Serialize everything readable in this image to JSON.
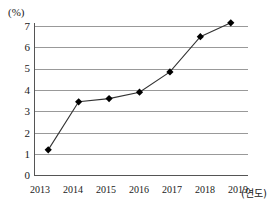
{
  "chart_data": {
    "type": "line",
    "title": "",
    "subtitle": "",
    "xlabel": "(연도)",
    "ylabel": "(%)",
    "categories": [
      "2013",
      "2014",
      "2015",
      "2016",
      "2017",
      "2018",
      "2019"
    ],
    "x": [
      2013,
      2014,
      2015,
      2016,
      2017,
      2018,
      2019
    ],
    "values": [
      1.2,
      3.45,
      3.6,
      3.9,
      4.85,
      6.5,
      7.15
    ],
    "series": [
      {
        "name": "",
        "values": [
          1.2,
          3.45,
          3.6,
          3.9,
          4.85,
          6.5,
          7.15
        ]
      }
    ],
    "ylim": [
      0,
      7
    ],
    "xlim": [
      2013,
      2019
    ],
    "ytick_labels": [
      "0",
      "1",
      "2",
      "3",
      "4",
      "5",
      "6",
      "7"
    ],
    "yticks": [
      0,
      1,
      2,
      3,
      4,
      5,
      6,
      7
    ],
    "grid": true,
    "grid_axis": "y",
    "legend": false,
    "legend_position": "none",
    "marker": "diamond",
    "line_color": "#333333",
    "marker_color": "#000000",
    "grid_color": "#999999",
    "axis_color": "#555555",
    "background_color": "#ffffff"
  },
  "axes": {
    "y_unit": "(%)",
    "x_unit": "(연도)"
  }
}
